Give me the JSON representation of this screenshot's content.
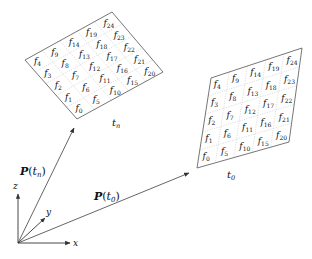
{
  "diagram": {
    "grids": [
      {
        "id": "grid-tn",
        "time_label": "t_n",
        "time_label_main": "t",
        "time_label_sub": "n",
        "rows": [
          [
            "f4",
            "f9",
            "f14",
            "f19",
            "f24"
          ],
          [
            "f3",
            "f8",
            "f13",
            "f18",
            "f23"
          ],
          [
            "f2",
            "f7",
            "f12",
            "f17",
            "f22"
          ],
          [
            "f1",
            "f6",
            "f11",
            "f16",
            "f21"
          ],
          [
            "f0",
            "f5",
            "f10",
            "f15",
            "f20"
          ]
        ]
      },
      {
        "id": "grid-t0",
        "time_label": "t_0",
        "time_label_main": "t",
        "time_label_sub": "0",
        "rows": [
          [
            "f4",
            "f9",
            "f14",
            "f19",
            "f24"
          ],
          [
            "f3",
            "f8",
            "f13",
            "f18",
            "f23"
          ],
          [
            "f2",
            "f7",
            "f12",
            "f17",
            "f22"
          ],
          [
            "f1",
            "f6",
            "f11",
            "f16",
            "f21"
          ],
          [
            "f0",
            "f5",
            "f10",
            "f15",
            "f20"
          ]
        ]
      }
    ],
    "vectors": [
      {
        "id": "P-tn",
        "label": "P(t_n)",
        "label_main": "P",
        "label_arg": "t",
        "label_sub": "n"
      },
      {
        "id": "P-t0",
        "label": "P(t_0)",
        "label_main": "P",
        "label_arg": "t",
        "label_sub": "0"
      }
    ],
    "axes": {
      "x": "x",
      "y": "y",
      "z": "z"
    },
    "colors": {
      "line": "#555555",
      "grid_dotted": "#bbbbbb",
      "text": "#111111"
    }
  }
}
